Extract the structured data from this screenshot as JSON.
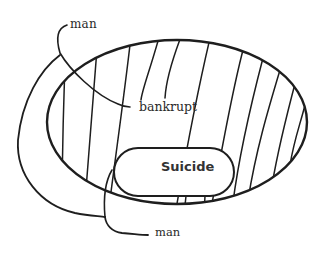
{
  "diagram": {
    "type": "nested-set (Euler) diagram",
    "labels": {
      "man_top": "man",
      "bankrupt": "bankrupt",
      "suicide": "Suicide",
      "man_bottom": "man"
    },
    "regions": [
      {
        "id": "bankrupt",
        "shape": "large hatched ellipse",
        "label": "bankrupt"
      },
      {
        "id": "suicide",
        "shape": "small rounded oval inside bankrupt",
        "label": "Suicide"
      },
      {
        "id": "man",
        "shape": "curved band wrapping the left side of bankrupt, crossing into it",
        "label": "man"
      }
    ],
    "colors": {
      "stroke": "#1e1e1e",
      "background": "#ffffff",
      "text": "#2a2a2a"
    }
  }
}
